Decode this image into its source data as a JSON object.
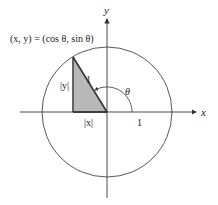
{
  "diagram": {
    "title_point_label": "(x,  y) = (cos θ,  sin θ)",
    "axis_labels": {
      "x": "x",
      "y": "y"
    },
    "hypotenuse_label": "1",
    "vertical_leg_label": "|y|",
    "horizontal_leg_label": "|x|",
    "angle_label": "θ",
    "unit_tick_label": "1",
    "angle_degrees": 121,
    "colors": {
      "line": "#333333",
      "triangle_fill": "#b8b8b8",
      "triangle_edge": "#444444",
      "background": "#ffffff"
    }
  }
}
